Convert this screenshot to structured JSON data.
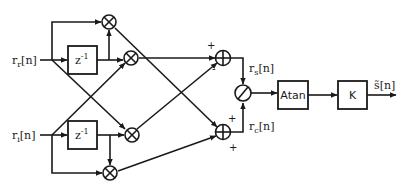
{
  "diagram": {
    "type": "signal-flow block diagram",
    "inputs": {
      "real": {
        "base": "r",
        "sub": "r",
        "suffix": "[n]"
      },
      "imag": {
        "base": "r",
        "sub": "i",
        "suffix": "[n]"
      }
    },
    "delays": {
      "top": {
        "label": "z",
        "exp": "-1"
      },
      "bottom": {
        "label": "z",
        "exp": "-1"
      }
    },
    "multipliers": [
      "multiplier-1",
      "multiplier-2",
      "multiplier-3",
      "multiplier-4"
    ],
    "adders": {
      "top": {
        "sign_in_1": "+",
        "sign_in_2": "-"
      },
      "bottom": {
        "sign_in_1": "+",
        "sign_in_2": "+"
      }
    },
    "intermediate": {
      "rs": {
        "base": "r",
        "sub": "s",
        "suffix": "[n]"
      },
      "rc": {
        "base": "r",
        "sub": "c",
        "suffix": "[n]"
      }
    },
    "blocks": {
      "atan": "Atan",
      "gain": "K"
    },
    "output": {
      "label": "s̃[n]"
    },
    "colors": {
      "line": "#1a1a1a",
      "background": "#ffffff"
    }
  }
}
